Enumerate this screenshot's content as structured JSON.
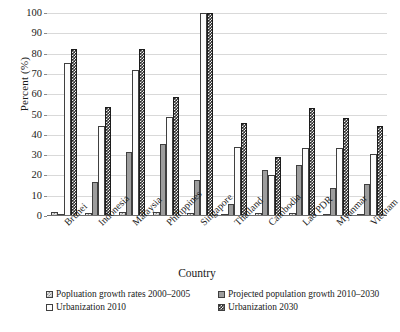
{
  "chart_data": {
    "type": "bar",
    "title": "",
    "xlabel": "Country",
    "ylabel": "Percent (%)",
    "ylim": [
      0,
      100
    ],
    "yticks": [
      0,
      10,
      20,
      30,
      40,
      50,
      60,
      70,
      80,
      90,
      100
    ],
    "grid": true,
    "legend_position": "bottom",
    "categories": [
      "Brunei",
      "Indonesia",
      "Malaysia",
      "Philippines",
      "Singapore",
      "Thailand",
      "Cambodia",
      "Lao PDR",
      "Myanmar",
      "Vietnam"
    ],
    "series": [
      {
        "name": "Popluation growth rates 2000–2005",
        "color": "#e9e9e9",
        "pattern": "checker-light",
        "values": [
          2.0,
          1.3,
          2.0,
          1.9,
          1.6,
          1.0,
          1.6,
          1.6,
          0.6,
          1.1
        ]
      },
      {
        "name": "Projected population growth 2010–2030",
        "color": "#9d9d9d",
        "pattern": "solid-grey",
        "values": [
          0.0,
          16.8,
          31.4,
          35.6,
          17.7,
          6.0,
          22.7,
          25.1,
          13.7,
          15.7
        ]
      },
      {
        "name": "Urbanization 2010",
        "color": "#fcfcfc",
        "pattern": "outline-white",
        "values": [
          75.4,
          44.3,
          72.0,
          48.9,
          100.0,
          34.0,
          20.1,
          33.3,
          33.6,
          30.4
        ]
      },
      {
        "name": "Urbanization 2030",
        "color": "#2b2b2b",
        "pattern": "checker-dark",
        "values": [
          82.2,
          53.7,
          82.2,
          58.4,
          100.0,
          45.8,
          29.1,
          53.0,
          48.2,
          44.1
        ]
      }
    ]
  }
}
